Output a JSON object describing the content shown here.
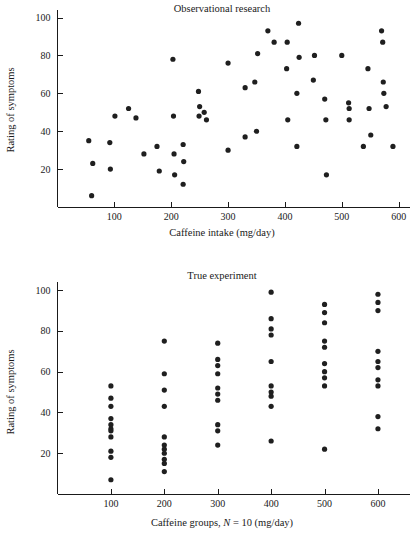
{
  "figure": {
    "background": "#ffffff",
    "marker_color": "#1f1f1f",
    "axis_color": "#1a1a1a"
  },
  "chart_data": [
    {
      "id": "observational",
      "type": "scatter",
      "title": "Observational research",
      "xlabel": "Caffeine intake (mg/day)",
      "ylabel": "Rating of symptoms",
      "xlim": [
        0,
        620
      ],
      "ylim": [
        0,
        104
      ],
      "xticks": [
        100,
        200,
        300,
        400,
        500,
        600
      ],
      "yticks": [
        20,
        40,
        60,
        80,
        100
      ],
      "grid": false,
      "legend": "none",
      "points": [
        [
          55,
          35
        ],
        [
          62,
          23
        ],
        [
          60,
          6
        ],
        [
          92,
          34
        ],
        [
          93,
          20
        ],
        [
          101,
          48
        ],
        [
          125,
          52
        ],
        [
          138,
          47
        ],
        [
          152,
          28
        ],
        [
          175,
          32
        ],
        [
          179,
          19
        ],
        [
          203,
          78
        ],
        [
          204,
          48
        ],
        [
          205,
          28
        ],
        [
          206,
          17
        ],
        [
          221,
          33
        ],
        [
          222,
          24
        ],
        [
          221,
          12
        ],
        [
          248,
          61
        ],
        [
          250,
          53
        ],
        [
          249,
          48
        ],
        [
          258,
          50
        ],
        [
          262,
          46
        ],
        [
          300,
          76
        ],
        [
          300,
          30
        ],
        [
          330,
          63
        ],
        [
          330,
          37
        ],
        [
          347,
          66
        ],
        [
          350,
          40
        ],
        [
          352,
          81
        ],
        [
          370,
          93
        ],
        [
          381,
          87
        ],
        [
          404,
          87
        ],
        [
          403,
          73
        ],
        [
          405,
          46
        ],
        [
          421,
          60
        ],
        [
          421,
          32
        ],
        [
          424,
          97
        ],
        [
          425,
          79
        ],
        [
          450,
          67
        ],
        [
          452,
          80
        ],
        [
          470,
          57
        ],
        [
          472,
          46
        ],
        [
          473,
          17
        ],
        [
          500,
          80
        ],
        [
          512,
          55
        ],
        [
          513,
          52
        ],
        [
          513,
          46
        ],
        [
          538,
          32
        ],
        [
          546,
          73
        ],
        [
          548,
          52
        ],
        [
          551,
          38
        ],
        [
          570,
          93
        ],
        [
          572,
          87
        ],
        [
          573,
          66
        ],
        [
          574,
          60
        ],
        [
          578,
          53
        ],
        [
          590,
          32
        ]
      ]
    },
    {
      "id": "true-experiment",
      "type": "scatter",
      "title": "True experiment",
      "xlabel": "Caffeine groups, N = 10 (mg/day)",
      "xlabel_prefix": "Caffeine groups, ",
      "xlabel_italic": "N",
      "xlabel_suffix": " = 10 (mg/day)",
      "ylabel": "Rating of symptoms",
      "xlim": [
        0,
        660
      ],
      "ylim": [
        0,
        104
      ],
      "xticks": [
        100,
        200,
        300,
        400,
        500,
        600
      ],
      "yticks": [
        20,
        40,
        60,
        80,
        100
      ],
      "grid": false,
      "legend": "none",
      "groups": [
        {
          "x": 100,
          "values": [
            53,
            47,
            43,
            37,
            34,
            32,
            31,
            28,
            21,
            18,
            7
          ]
        },
        {
          "x": 200,
          "values": [
            75,
            59,
            51,
            43,
            28,
            24,
            22,
            20,
            17,
            15,
            11
          ]
        },
        {
          "x": 300,
          "values": [
            74,
            66,
            63,
            59,
            52,
            49,
            46,
            34,
            31,
            24
          ]
        },
        {
          "x": 400,
          "values": [
            99,
            86,
            81,
            78,
            65,
            53,
            50,
            48,
            43,
            26
          ]
        },
        {
          "x": 500,
          "values": [
            93,
            89,
            84,
            75,
            72,
            64,
            60,
            57,
            53,
            22
          ]
        },
        {
          "x": 600,
          "values": [
            98,
            94,
            90,
            70,
            65,
            62,
            56,
            53,
            38,
            32
          ]
        }
      ]
    }
  ]
}
